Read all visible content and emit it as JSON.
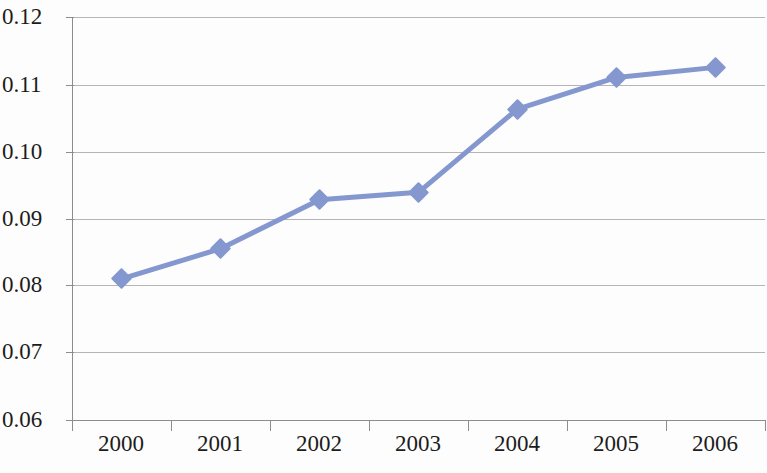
{
  "chart_data": {
    "type": "line",
    "title": "",
    "subtitle": "",
    "xlabel": "",
    "ylabel": "",
    "categories": [
      "2000",
      "2001",
      "2002",
      "2003",
      "2004",
      "2005",
      "2006"
    ],
    "series": [
      {
        "name": "series-1",
        "values": [
          0.081,
          0.0855,
          0.0928,
          0.0939,
          0.1063,
          0.111,
          0.1125
        ],
        "color": "#8497cf",
        "marker": "diamond"
      }
    ],
    "ylim": [
      0.06,
      0.12
    ],
    "yticks": [
      0.12,
      0.11,
      0.1,
      0.09,
      0.08,
      0.07,
      0.06
    ],
    "ytick_labels": [
      "0.12",
      "0.11",
      "0.10",
      "0.09",
      "0.08",
      "0.07",
      "0.06"
    ],
    "xtick_labels": [
      "2000",
      "2001",
      "2002",
      "2003",
      "2004",
      "2005",
      "2006"
    ],
    "grid": "horizontal",
    "legend": "none",
    "background_color": "#fdfdfd",
    "gridline_color": "#a8a8a8",
    "axis_color": "#8c8c8c",
    "text_color": "#1c1c1c"
  }
}
